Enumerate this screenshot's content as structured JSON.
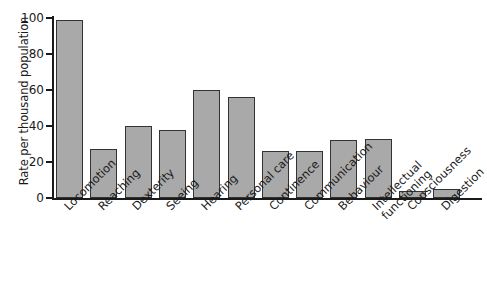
{
  "chart_data": {
    "type": "bar",
    "title": "",
    "xlabel": "",
    "ylabel": "Rate per thousand population",
    "ylim": [
      0,
      100
    ],
    "yticks": [
      0,
      20,
      40,
      60,
      80,
      100
    ],
    "grid": false,
    "legend": null,
    "bar_color": "#a9a9a9",
    "bar_edge_color": "#333333",
    "categories": [
      "Locomotion",
      "Reaching",
      "Dexterity",
      "Seeing",
      "Hearing",
      "Personal care",
      "Continence",
      "Communication",
      "Behaviour",
      "Intellectual functioning",
      "Consciousness",
      "Digestion"
    ],
    "values": [
      99,
      27,
      40,
      38,
      60,
      56,
      26,
      26,
      32,
      33,
      4,
      5
    ]
  },
  "axis": {
    "y_title": "Rate per thousand population",
    "tick_labels": [
      "0",
      "20",
      "40",
      "60",
      "80",
      "100"
    ]
  },
  "labels": {
    "items": [
      {
        "text": "Locomotion",
        "line2": ""
      },
      {
        "text": "Reaching",
        "line2": ""
      },
      {
        "text": "Dexterity",
        "line2": ""
      },
      {
        "text": "Seeing",
        "line2": ""
      },
      {
        "text": "Hearing",
        "line2": ""
      },
      {
        "text": "Personal care",
        "line2": ""
      },
      {
        "text": "Continence",
        "line2": ""
      },
      {
        "text": "Communication",
        "line2": ""
      },
      {
        "text": "Behaviour",
        "line2": ""
      },
      {
        "text": "Intellectual",
        "line2": "functioning"
      },
      {
        "text": "Consciousness",
        "line2": ""
      },
      {
        "text": "Digestion",
        "line2": ""
      }
    ]
  }
}
